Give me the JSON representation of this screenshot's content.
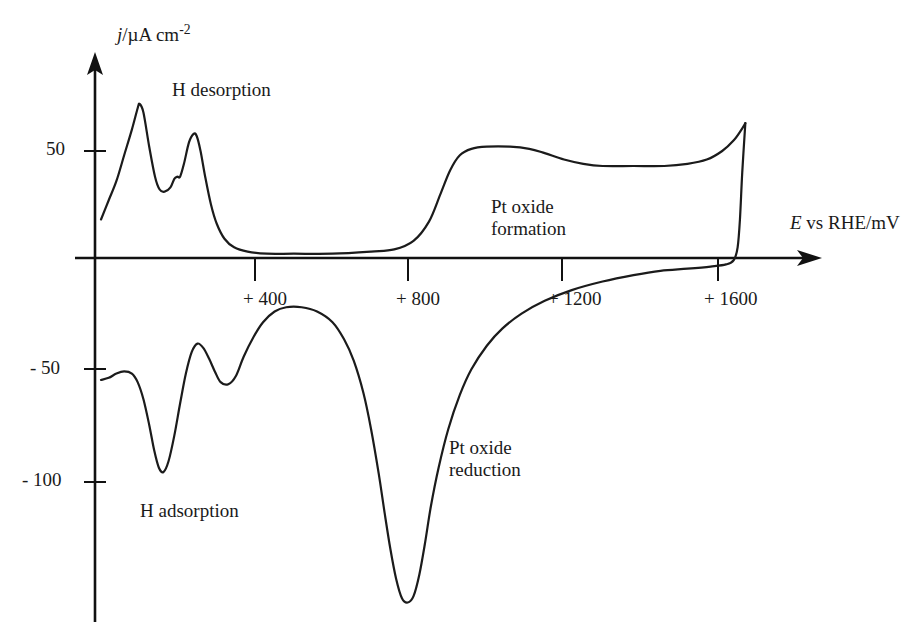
{
  "figure": {
    "title": "",
    "background_color": "#ffffff",
    "line_color": "#1b1b1b"
  },
  "axes": {
    "y_label_main": "j",
    "y_label_rest": "/µA cm",
    "y_label_exponent": "-2",
    "x_label_main": "E",
    "x_label_rest": " vs RHE/mV",
    "y_ticks": [
      {
        "label": "50",
        "value": 50
      },
      {
        "label": "- 50",
        "value": -50
      },
      {
        "label": "- 100",
        "value": -100
      }
    ],
    "x_ticks": [
      {
        "label": "+ 400",
        "value": 400
      },
      {
        "label": "+ 800",
        "value": 800
      },
      {
        "label": "+ 1200",
        "value": 1200
      },
      {
        "label": "+ 1600",
        "value": 1600
      }
    ]
  },
  "annotations": [
    {
      "id": "h-desorption",
      "text": "H desorption"
    },
    {
      "id": "h-adsorption",
      "text": "H adsorption"
    },
    {
      "id": "pt-oxide-formation-l1",
      "text": "Pt oxide"
    },
    {
      "id": "pt-oxide-formation-l2",
      "text": "formation"
    },
    {
      "id": "pt-oxide-reduction-l1",
      "text": "Pt oxide"
    },
    {
      "id": "pt-oxide-reduction-l2",
      "text": "reduction"
    }
  ],
  "chart_data": {
    "type": "line",
    "title": "",
    "xlabel": "E vs RHE/mV",
    "ylabel": "j/µA cm-2",
    "xlim": [
      0,
      1750
    ],
    "ylim": [
      -165,
      80
    ],
    "grid": false,
    "legend": "none",
    "x_ticks": [
      400,
      800,
      1200,
      1600
    ],
    "y_ticks": [
      50,
      -50,
      -100
    ],
    "series": [
      {
        "name": "anodic-sweep",
        "comment": "positive-going scan: H desorption peaks then Pt oxide formation plateau",
        "points": [
          [
            0,
            18
          ],
          [
            20,
            27
          ],
          [
            40,
            36
          ],
          [
            60,
            48
          ],
          [
            80,
            60
          ],
          [
            95,
            70
          ],
          [
            100,
            72
          ],
          [
            110,
            68
          ],
          [
            125,
            52
          ],
          [
            140,
            38
          ],
          [
            152,
            32
          ],
          [
            165,
            31
          ],
          [
            180,
            33
          ],
          [
            190,
            37
          ],
          [
            198,
            38
          ],
          [
            205,
            38
          ],
          [
            215,
            44
          ],
          [
            228,
            54
          ],
          [
            240,
            58
          ],
          [
            248,
            57
          ],
          [
            258,
            50
          ],
          [
            270,
            38
          ],
          [
            285,
            25
          ],
          [
            300,
            16
          ],
          [
            320,
            9
          ],
          [
            345,
            5
          ],
          [
            380,
            3
          ],
          [
            430,
            2
          ],
          [
            500,
            2
          ],
          [
            600,
            2
          ],
          [
            700,
            3
          ],
          [
            760,
            4
          ],
          [
            810,
            8
          ],
          [
            850,
            17
          ],
          [
            880,
            30
          ],
          [
            905,
            41
          ],
          [
            930,
            48
          ],
          [
            960,
            51
          ],
          [
            1000,
            52
          ],
          [
            1060,
            52
          ],
          [
            1110,
            51
          ],
          [
            1150,
            49
          ],
          [
            1200,
            46
          ],
          [
            1250,
            44
          ],
          [
            1300,
            43
          ],
          [
            1380,
            43
          ],
          [
            1460,
            43
          ],
          [
            1520,
            44
          ],
          [
            1570,
            46
          ],
          [
            1610,
            50
          ],
          [
            1640,
            55
          ],
          [
            1660,
            60
          ],
          [
            1670,
            63
          ]
        ]
      },
      {
        "name": "cathodic-sweep",
        "comment": "negative-going scan: Pt oxide reduction peak then H adsorption peaks",
        "points": [
          [
            1670,
            63
          ],
          [
            1662,
            40
          ],
          [
            1656,
            18
          ],
          [
            1650,
            5
          ],
          [
            1640,
            -1
          ],
          [
            1620,
            -3
          ],
          [
            1580,
            -4
          ],
          [
            1520,
            -5
          ],
          [
            1450,
            -6
          ],
          [
            1380,
            -8
          ],
          [
            1300,
            -11
          ],
          [
            1220,
            -15
          ],
          [
            1150,
            -20
          ],
          [
            1090,
            -26
          ],
          [
            1040,
            -33
          ],
          [
            1000,
            -41
          ],
          [
            960,
            -52
          ],
          [
            930,
            -64
          ],
          [
            900,
            -80
          ],
          [
            875,
            -98
          ],
          [
            855,
            -116
          ],
          [
            840,
            -133
          ],
          [
            825,
            -148
          ],
          [
            810,
            -158
          ],
          [
            795,
            -161
          ],
          [
            780,
            -159
          ],
          [
            765,
            -150
          ],
          [
            750,
            -136
          ],
          [
            735,
            -119
          ],
          [
            720,
            -101
          ],
          [
            700,
            -80
          ],
          [
            680,
            -63
          ],
          [
            655,
            -48
          ],
          [
            630,
            -38
          ],
          [
            600,
            -30
          ],
          [
            560,
            -25
          ],
          [
            520,
            -23
          ],
          [
            480,
            -23
          ],
          [
            450,
            -25
          ],
          [
            420,
            -30
          ],
          [
            395,
            -37
          ],
          [
            370,
            -46
          ],
          [
            350,
            -55
          ],
          [
            330,
            -59
          ],
          [
            310,
            -58
          ],
          [
            295,
            -53
          ],
          [
            280,
            -47
          ],
          [
            265,
            -42
          ],
          [
            250,
            -40
          ],
          [
            235,
            -44
          ],
          [
            220,
            -54
          ],
          [
            205,
            -68
          ],
          [
            190,
            -83
          ],
          [
            175,
            -95
          ],
          [
            162,
            -100
          ],
          [
            150,
            -98
          ],
          [
            138,
            -90
          ],
          [
            125,
            -78
          ],
          [
            110,
            -66
          ],
          [
            95,
            -58
          ],
          [
            80,
            -54
          ],
          [
            60,
            -53
          ],
          [
            40,
            -54
          ],
          [
            20,
            -56
          ],
          [
            0,
            -57
          ]
        ]
      }
    ]
  }
}
